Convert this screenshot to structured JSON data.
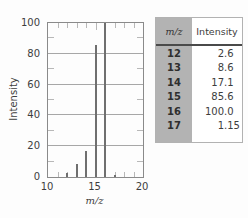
{
  "chart_data": {
    "type": "bar",
    "xlabel": "m/z",
    "ylabel": "Intensity",
    "x": [
      12,
      13,
      14,
      15,
      16,
      17
    ],
    "values": [
      2.6,
      8.6,
      17.1,
      85.6,
      100.0,
      1.15
    ],
    "xlim": [
      10,
      20
    ],
    "ylim": [
      0,
      100
    ],
    "x_major_ticks": [
      10,
      15,
      20
    ],
    "x_minor_step": 1,
    "y_major_ticks": [
      0,
      20,
      40,
      60,
      80,
      100
    ],
    "y_minor_step": 10,
    "grid": "major-horizontal",
    "legend": "none",
    "colors": {
      "bar": "#6f6f6f",
      "grid": "#a7a7a7",
      "axis": "#8a8a8a"
    }
  },
  "table": {
    "headers": {
      "mz": "m/z",
      "intensity": "Intensity"
    },
    "rows": [
      {
        "mz": "12",
        "intensity": "2.6"
      },
      {
        "mz": "13",
        "intensity": "8.6"
      },
      {
        "mz": "14",
        "intensity": "17.1"
      },
      {
        "mz": "15",
        "intensity": "85.6"
      },
      {
        "mz": "16",
        "intensity": "100.0"
      },
      {
        "mz": "17",
        "intensity": "1.15"
      }
    ],
    "colors": {
      "mz_column_bg": "#b3b3b3"
    }
  }
}
